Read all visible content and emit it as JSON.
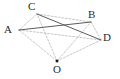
{
  "figure": {
    "kind": "geometry-diagram",
    "width": 120,
    "height": 79,
    "background_color": "#ffffff",
    "stroke_color_solid": "#4a4a4a",
    "stroke_color_dashed": "#b0b0b0",
    "label_color": "#2b2b2b",
    "point_marker_color": "#1a1a1a",
    "labels": {
      "a": "A",
      "b": "B",
      "c": "C",
      "d": "D",
      "o": "O"
    },
    "points": [
      {
        "id": "A",
        "label": "A",
        "x": 19,
        "y": 30,
        "label_x": 4,
        "label_y": 24,
        "marker": false
      },
      {
        "id": "C",
        "label": "C",
        "x": 37,
        "y": 14,
        "label_x": 28,
        "label_y": 1,
        "marker": false
      },
      {
        "id": "B",
        "label": "B",
        "x": 91,
        "y": 22,
        "label_x": 88,
        "label_y": 9,
        "marker": false
      },
      {
        "id": "D",
        "label": "D",
        "x": 101,
        "y": 40,
        "label_x": 103,
        "label_y": 32,
        "marker": false
      },
      {
        "id": "O",
        "label": "O",
        "x": 57,
        "y": 61,
        "label_x": 53,
        "label_y": 64,
        "marker": true
      }
    ],
    "segments": [
      {
        "from": "A",
        "to": "B",
        "style": "solid"
      },
      {
        "from": "C",
        "to": "D",
        "style": "solid"
      },
      {
        "from": "A",
        "to": "C",
        "style": "dashed"
      },
      {
        "from": "C",
        "to": "B",
        "style": "dashed"
      },
      {
        "from": "B",
        "to": "D",
        "style": "dashed"
      },
      {
        "from": "A",
        "to": "D",
        "style": "dashed"
      },
      {
        "from": "O",
        "to": "A",
        "style": "dashed"
      },
      {
        "from": "O",
        "to": "C",
        "style": "dashed"
      },
      {
        "from": "O",
        "to": "B",
        "style": "dashed"
      },
      {
        "from": "O",
        "to": "D",
        "style": "dashed"
      }
    ]
  }
}
